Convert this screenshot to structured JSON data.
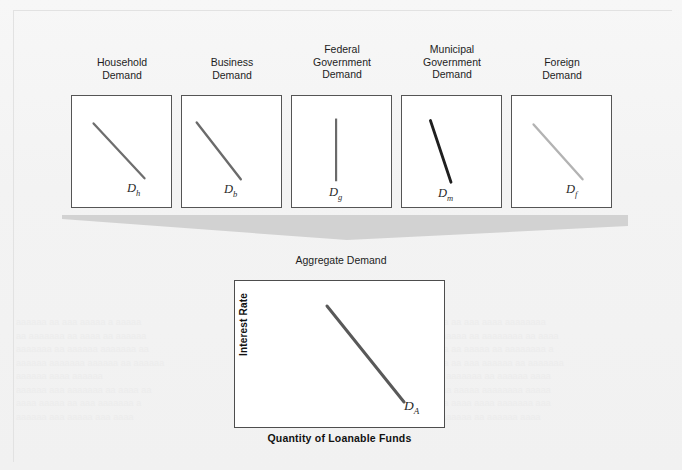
{
  "figure": {
    "type": "diagram",
    "aggregate_caption": "Aggregate Demand"
  },
  "components": [
    {
      "caption": "Household\nDemand",
      "curve_symbol": "D",
      "curve_subscript": "h",
      "slope": "downward",
      "line_color": "#6e6e6e",
      "line_width": 2.3,
      "x1": 22,
      "y1": 28,
      "x2": 74,
      "y2": 84
    },
    {
      "caption": "Business\nDemand",
      "curve_symbol": "D",
      "curve_subscript": "b",
      "slope": "downward",
      "line_color": "#6b6b6b",
      "line_width": 2.4,
      "x1": 15,
      "y1": 27,
      "x2": 60,
      "y2": 85
    },
    {
      "caption": "Federal\nGovernment\nDemand",
      "curve_symbol": "D",
      "curve_subscript": "g",
      "slope": "vertical",
      "line_color": "#6a6a6a",
      "line_width": 2.2,
      "x1": 45,
      "y1": 23,
      "x2": 45,
      "y2": 87
    },
    {
      "caption": "Municipal\nGovernment\nDemand",
      "curve_symbol": "D",
      "curve_subscript": "m",
      "slope": "steep-downward",
      "line_color": "#1f1f1f",
      "line_width": 2.9,
      "x1": 29,
      "y1": 25,
      "x2": 50,
      "y2": 88
    },
    {
      "caption": "Foreign\nDemand",
      "curve_symbol": "D",
      "curve_subscript": "f",
      "slope": "downward",
      "line_color": "#b3b3b3",
      "line_width": 2.4,
      "x1": 22,
      "y1": 29,
      "x2": 72,
      "y2": 85
    }
  ],
  "aggregate_chart": {
    "ylabel": "Interest Rate",
    "xlabel": "Quantity of Loanable Funds",
    "curve_symbol": "D",
    "curve_subscript": "A",
    "line_color": "#595959",
    "line_width": 3.0,
    "x1": 93,
    "y1": 26,
    "x2": 170,
    "y2": 122
  },
  "funnel": {
    "fill_color": "#d2d2d2",
    "description": "wide gray wedge converging downward from the five panels to the aggregate chart"
  },
  "colors": {
    "page_background": "#f3f3f3",
    "panel_background": "#ffffff",
    "panel_border": "#555555",
    "text": "#1d1d1d"
  },
  "ghost": {
    "left": "aaaaaa aa aaa aaaaa a  aaaaa\naa  aaaaaaa aa aaaa aa aaaaaa\naaaaaaa aa aaaaaa aaaaaaa aa\naaaaaa aaaaaaa  aaaaaa  aa aaaaaa\n    aaaaaa aaaa aaaaaa\naaaaaa  aaa aaaaaaa aa aaaa aa\naaaa aaaaa aa aaa  aaaaaaa a\naaaaaa aaa aaaaa aaa aaaa",
    "right": "aaaaaa aa aaa aaaa aaaaaaaa\naaaa aaaaa aa aaaaaaaa aa aaaa\naaaaaa aa aaaaa aa aaaaaaaa a\naaaaaa aa aaa aaaaaa aa aaaaaaa\naaaaa aaaaaaa aa aaaaaa aaaa\naaaa aa aaaaa aaaaaaaa aaaaa\naaaaaa aaaa aaaa  aaaaaaa aaa\naaaa  aaaaaa aa aaaaaa aaaa"
  }
}
